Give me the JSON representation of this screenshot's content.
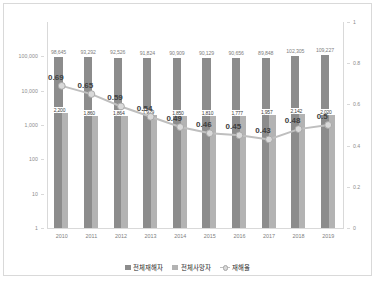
{
  "chart_data": {
    "type": "bar",
    "title": "",
    "xlabel": "",
    "ylabel": "",
    "y_left": {
      "scale": "log",
      "ticks": [
        "100,000",
        "10,000",
        "1,000",
        "100",
        "10",
        "1"
      ],
      "min": 1,
      "max": 1000000
    },
    "y_right": {
      "scale": "linear",
      "ticks": [
        "1",
        "0.8",
        "0.6",
        "0.4",
        "0.2",
        "0"
      ],
      "min": 0,
      "max": 1
    },
    "grid": false,
    "legend_position": "bottom",
    "categories": [
      "2010",
      "2011",
      "2012",
      "2013",
      "2014",
      "2015",
      "2016",
      "2017",
      "2018",
      "2019"
    ],
    "series": [
      {
        "name": "전체재해자",
        "type": "bar",
        "axis": "left",
        "color": "#8c8c8c",
        "values": [
          98645,
          93292,
          92526,
          91824,
          90909,
          90129,
          90656,
          89848,
          102305,
          109227
        ],
        "labels": [
          "98,645",
          "93,292",
          "92,526",
          "91,824",
          "90,909",
          "90,129",
          "90,656",
          "89,848",
          "102,305",
          "109,227"
        ]
      },
      {
        "name": "전체사망자",
        "type": "bar",
        "axis": "left",
        "color": "#b3b3b3",
        "values": [
          2200,
          1860,
          1864,
          1929,
          1850,
          1810,
          1777,
          1957,
          2142,
          2020
        ],
        "labels": [
          "2,200",
          "1,860",
          "1,864",
          "1,929",
          "1,850",
          "1,810",
          "1,777",
          "1,957",
          "2,142",
          "2,020"
        ]
      },
      {
        "name": "재해율",
        "type": "line",
        "axis": "right",
        "color": "#bfbfbf",
        "values": [
          0.69,
          0.65,
          0.59,
          0.54,
          0.49,
          0.46,
          0.45,
          0.43,
          0.48,
          0.5
        ],
        "labels": [
          "0.69",
          "0.65",
          "0.59",
          "0.54",
          "0.49",
          "0.46",
          "0.45",
          "0.43",
          "0.48",
          "0.5"
        ]
      }
    ]
  },
  "legend": {
    "items": [
      {
        "label": "전체재해자"
      },
      {
        "label": "전체사망자"
      },
      {
        "label": "재해율"
      }
    ]
  }
}
